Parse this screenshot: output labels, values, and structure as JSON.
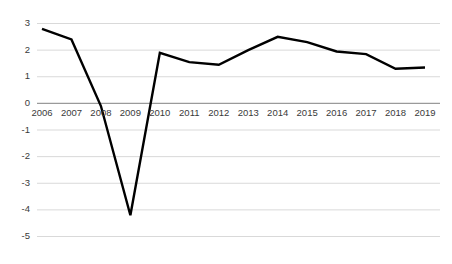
{
  "chart_data": {
    "type": "line",
    "title": "",
    "subtitle": "",
    "xlabel": "",
    "ylabel": "",
    "categories": [
      "2006",
      "2007",
      "2008",
      "2009",
      "2010",
      "2011",
      "2012",
      "2013",
      "2014",
      "2015",
      "2016",
      "2017",
      "2018",
      "2019"
    ],
    "values": [
      2.8,
      2.4,
      -0.1,
      -4.2,
      1.9,
      1.55,
      1.45,
      2.0,
      2.5,
      2.3,
      1.95,
      1.85,
      1.3,
      1.35
    ],
    "series": [
      {
        "name": "",
        "values": [
          2.8,
          2.4,
          -0.1,
          -4.2,
          1.9,
          1.55,
          1.45,
          2.0,
          2.5,
          2.3,
          1.95,
          1.85,
          1.3,
          1.35
        ]
      }
    ],
    "ylim": [
      -5,
      3
    ],
    "xlim": [
      "2006",
      "2019"
    ],
    "y_ticks": [
      3,
      2,
      1,
      0,
      -1,
      -2,
      -3,
      -4,
      -5
    ],
    "y_tick_labels": [
      "3",
      "2",
      "1",
      "0",
      "-1",
      "-2",
      "-3",
      "-4",
      "-5"
    ],
    "x_ticks": [
      "2006",
      "2007",
      "2008",
      "2009",
      "2010",
      "2011",
      "2012",
      "2013",
      "2014",
      "2015",
      "2016",
      "2017",
      "2018",
      "2019"
    ],
    "grid": true,
    "grid_axis": "y",
    "legend": false,
    "legend_position": "none",
    "line_color": "#000000",
    "line_width": 2.4,
    "markers": false,
    "gridline_color": "#d9d9d9",
    "zeroline_color": "#9a9a9a",
    "tick_label_color": "#3a3a3a",
    "background_color": "#ffffff",
    "annotations": []
  },
  "axes": {
    "y_labels": [
      "3",
      "2",
      "1",
      "0",
      "-1",
      "-2",
      "-3",
      "-4",
      "-5"
    ],
    "x_labels": [
      "2006",
      "2007",
      "2008",
      "2009",
      "2010",
      "2011",
      "2012",
      "2013",
      "2014",
      "2015",
      "2016",
      "2017",
      "2018",
      "2019"
    ]
  }
}
